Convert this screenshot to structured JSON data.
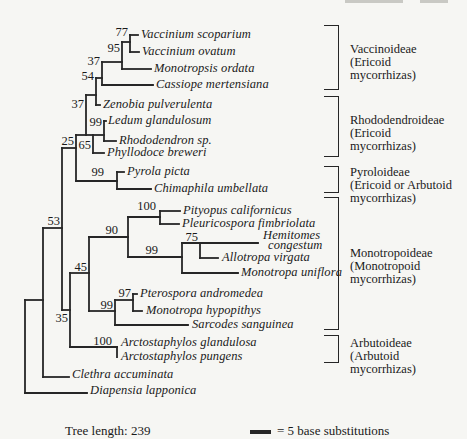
{
  "figure": {
    "background": "#f6f6f3",
    "ink_color": "#1a1a1a",
    "line_color": "#262626"
  },
  "tree": {
    "segments": [
      [
        130,
        35,
        130,
        52
      ],
      [
        122,
        42,
        122,
        69
      ],
      [
        102,
        62,
        102,
        85
      ],
      [
        96,
        78,
        96,
        105
      ],
      [
        86,
        95,
        86,
        135
      ],
      [
        104,
        121,
        104,
        141
      ],
      [
        93,
        135,
        93,
        153
      ],
      [
        76,
        135,
        76,
        181
      ],
      [
        117,
        172,
        117,
        189
      ],
      [
        62,
        148,
        62,
        310
      ],
      [
        43,
        228,
        43,
        377
      ],
      [
        25,
        300,
        25,
        393
      ],
      [
        70,
        273,
        70,
        347
      ],
      [
        89,
        237,
        89,
        311
      ],
      [
        128,
        217,
        128,
        257
      ],
      [
        160,
        211,
        160,
        224
      ],
      [
        182,
        243,
        182,
        273
      ],
      [
        200,
        243,
        200,
        258
      ],
      [
        133,
        294,
        133,
        311
      ],
      [
        115,
        300,
        115,
        325
      ],
      [
        117,
        347,
        117,
        357
      ],
      [
        130,
        35,
        138,
        35
      ],
      [
        130,
        52,
        139,
        52
      ],
      [
        122,
        69,
        151,
        69
      ],
      [
        102,
        85,
        153,
        85
      ],
      [
        122,
        42,
        130,
        42
      ],
      [
        102,
        62,
        122,
        62
      ],
      [
        96,
        78,
        102,
        78
      ],
      [
        96,
        105,
        100,
        105
      ],
      [
        86,
        95,
        96,
        95
      ],
      [
        76,
        135,
        104,
        135
      ],
      [
        104,
        121,
        106,
        121
      ],
      [
        104,
        141,
        116,
        141
      ],
      [
        93,
        153,
        104,
        153
      ],
      [
        76,
        181,
        117,
        181
      ],
      [
        117,
        172,
        124,
        172
      ],
      [
        117,
        189,
        151,
        189
      ],
      [
        62,
        148,
        76,
        148
      ],
      [
        43,
        228,
        62,
        228
      ],
      [
        43,
        377,
        69,
        377
      ],
      [
        25,
        300,
        43,
        300
      ],
      [
        25,
        393,
        87,
        393
      ],
      [
        62,
        310,
        70,
        310
      ],
      [
        70,
        273,
        89,
        273
      ],
      [
        89,
        237,
        128,
        237
      ],
      [
        128,
        217,
        160,
        217
      ],
      [
        160,
        211,
        180,
        211
      ],
      [
        160,
        224,
        179,
        224
      ],
      [
        128,
        257,
        182,
        257
      ],
      [
        182,
        243,
        258,
        243
      ],
      [
        200,
        258,
        218,
        258
      ],
      [
        182,
        273,
        238,
        273
      ],
      [
        89,
        311,
        115,
        311
      ],
      [
        115,
        300,
        133,
        300
      ],
      [
        133,
        294,
        137,
        294
      ],
      [
        133,
        311,
        142,
        311
      ],
      [
        115,
        325,
        188,
        325
      ],
      [
        70,
        347,
        117,
        347
      ]
    ],
    "tip_labels": [
      {
        "text": "Vaccinium scoparium",
        "x": 141,
        "y": 35
      },
      {
        "text": "Vaccinium ovatum",
        "x": 142,
        "y": 52
      },
      {
        "text": "Monotropsis ordata",
        "x": 154,
        "y": 69
      },
      {
        "text": "Cassiope mertensiana",
        "x": 156,
        "y": 85
      },
      {
        "text": "Zenobia pulverulenta",
        "x": 103,
        "y": 105
      },
      {
        "text": "Ledum glandulosum",
        "x": 108,
        "y": 121
      },
      {
        "text": "Rhododendron sp.",
        "x": 119,
        "y": 141
      },
      {
        "text": "Phyllodoce breweri",
        "x": 107,
        "y": 153
      },
      {
        "text": "Pyrola picta",
        "x": 127,
        "y": 172
      },
      {
        "text": "Chimaphila umbellata",
        "x": 154,
        "y": 189
      },
      {
        "text": "Pityopus californicus",
        "x": 183,
        "y": 211
      },
      {
        "text": "Pleuricospora fimbriolata",
        "x": 182,
        "y": 224
      },
      {
        "text": "Hemitomes",
        "x": 263,
        "y": 236
      },
      {
        "text": "congestum",
        "x": 268,
        "y": 246
      },
      {
        "text": "Allotropa virgata",
        "x": 222,
        "y": 258
      },
      {
        "text": "Monotropa uniflora",
        "x": 241,
        "y": 273
      },
      {
        "text": "Pterospora andromedea",
        "x": 140,
        "y": 294
      },
      {
        "text": "Monotropa hypopithys",
        "x": 146,
        "y": 311
      },
      {
        "text": "Sarcodes sanguinea",
        "x": 192,
        "y": 325
      },
      {
        "text": "Arctostaphylos glandulosa",
        "x": 121,
        "y": 343
      },
      {
        "text": "Arctostaphylos pungens",
        "x": 121,
        "y": 357
      },
      {
        "text": "Clethra accuminata",
        "x": 72,
        "y": 375
      },
      {
        "text": "Diapensia lapponica",
        "x": 90,
        "y": 391
      }
    ],
    "bootstrap_values": [
      {
        "value": "77",
        "x": 128,
        "y": 32
      },
      {
        "value": "95",
        "x": 120,
        "y": 48
      },
      {
        "value": "37",
        "x": 100,
        "y": 61
      },
      {
        "value": "54",
        "x": 94,
        "y": 76
      },
      {
        "value": "37",
        "x": 84,
        "y": 104
      },
      {
        "value": "99",
        "x": 102,
        "y": 122
      },
      {
        "value": "65",
        "x": 91,
        "y": 145
      },
      {
        "value": "25",
        "x": 74,
        "y": 141
      },
      {
        "value": "99",
        "x": 104,
        "y": 172
      },
      {
        "value": "53",
        "x": 60,
        "y": 221
      },
      {
        "value": "100",
        "x": 156,
        "y": 206
      },
      {
        "value": "90",
        "x": 118,
        "y": 230
      },
      {
        "value": "75",
        "x": 198,
        "y": 237
      },
      {
        "value": "99",
        "x": 158,
        "y": 250
      },
      {
        "value": "45",
        "x": 87,
        "y": 267
      },
      {
        "value": "97",
        "x": 131,
        "y": 293
      },
      {
        "value": "99",
        "x": 113,
        "y": 305
      },
      {
        "value": "35",
        "x": 68,
        "y": 318
      },
      {
        "value": "100",
        "x": 112,
        "y": 341
      }
    ],
    "clades": [
      {
        "lines": [
          "Vaccinoideae",
          "(Ericoid",
          "mycorrhizas)"
        ],
        "bracket": {
          "x": 324,
          "w": 15,
          "y1": 25,
          "y2": 90
        },
        "label_x": 350,
        "label_y": 43
      },
      {
        "lines": [
          "Rhododendroideae",
          "(Ericoid",
          "mycorrhizas)"
        ],
        "bracket": {
          "x": 324,
          "w": 15,
          "y1": 96,
          "y2": 157
        },
        "label_x": 350,
        "label_y": 114
      },
      {
        "lines": [
          "Pyroloideae",
          "(Ericoid or Arbutoid",
          "mycorrhizas)"
        ],
        "bracket": {
          "x": 324,
          "w": 15,
          "y1": 166,
          "y2": 193
        },
        "label_x": 350,
        "label_y": 166
      },
      {
        "lines": [
          "Monotropoideae",
          "(Monotropoid",
          "mycorrhizas)"
        ],
        "bracket": {
          "x": 324,
          "w": 15,
          "y1": 197,
          "y2": 330
        },
        "label_x": 350,
        "label_y": 247
      },
      {
        "lines": [
          "Arbutoideae",
          "(Arbutoid",
          "mycorrhizas)"
        ],
        "bracket": {
          "x": 324,
          "w": 15,
          "y1": 335,
          "y2": 363
        },
        "label_x": 350,
        "label_y": 337
      }
    ]
  },
  "footer": {
    "tree_length": "Tree length: 239",
    "scale_text": "= 5 base substitutions"
  },
  "artifacts": [
    {
      "x": 345,
      "y": 0,
      "w": 58,
      "h": 3
    },
    {
      "x": 420,
      "y": 0,
      "w": 28,
      "h": 3
    }
  ]
}
